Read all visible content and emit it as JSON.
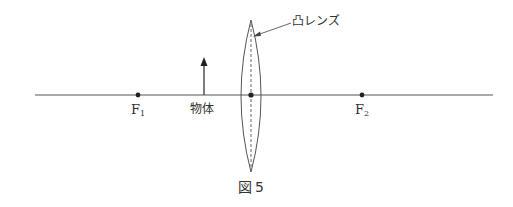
{
  "figure": {
    "caption": "図５",
    "caption_number": "5"
  },
  "labels": {
    "lens": "凸レンズ",
    "object": "物体",
    "focus1_letter": "F",
    "focus1_sub": "1",
    "focus2_letter": "F",
    "focus2_sub": "2"
  },
  "geometry": {
    "axis": {
      "x1": 35,
      "x2": 493,
      "y": 95
    },
    "lens": {
      "cx": 251,
      "top": 20,
      "bottom": 172,
      "half_width": 10
    },
    "object_arrow": {
      "x": 204,
      "base_y": 95,
      "tip_y": 58
    },
    "focus_points": [
      {
        "name": "F1",
        "x": 138
      },
      {
        "name": "F2",
        "x": 362
      }
    ],
    "line_color": "#555555"
  }
}
